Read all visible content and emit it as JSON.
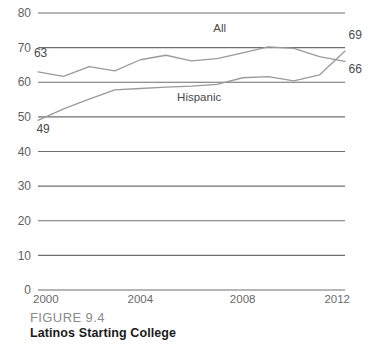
{
  "figure": {
    "number_label": "FIGURE 9.4",
    "title": "Latinos Starting College"
  },
  "colors": {
    "gridline": "#6e6e6e",
    "series_all": "#9a9a9a",
    "series_hispanic": "#9a9a9a",
    "axis_text": "#5f5f5f",
    "caption_number": "#8a8a8a",
    "caption_title": "#1a1a1a",
    "background": "#ffffff"
  },
  "chart_data": {
    "type": "line",
    "title": "Latinos Starting College",
    "xlabel": "",
    "ylabel": "",
    "xlim": [
      2000,
      2012
    ],
    "ylim": [
      0,
      80
    ],
    "grid": true,
    "legend_position": "inline-annotation",
    "ytick_labels": [
      "80",
      "70",
      "60",
      "50",
      "40",
      "30",
      "20",
      "10",
      "0"
    ],
    "yticks": [
      80,
      70,
      60,
      50,
      40,
      30,
      20,
      10,
      0
    ],
    "xtick_labels": [
      "2000",
      "2004",
      "2008",
      "2012"
    ],
    "xticks": [
      2000,
      2004,
      2008,
      2012
    ],
    "x": [
      2000,
      2001,
      2002,
      2003,
      2004,
      2005,
      2006,
      2007,
      2008,
      2009,
      2010,
      2011,
      2012
    ],
    "series": [
      {
        "name": "All",
        "label": "All",
        "values": [
          63,
          61.7,
          64.5,
          63.3,
          66.5,
          67.8,
          66.2,
          66.8,
          68.5,
          70.2,
          69.8,
          67.4,
          66
        ],
        "start_value_label": "63",
        "end_value_label": "66"
      },
      {
        "name": "Hispanic",
        "label": "Hispanic",
        "values": [
          49,
          52.3,
          55.1,
          57.8,
          58.2,
          58.6,
          58.9,
          59.4,
          61.3,
          61.6,
          60.4,
          62.1,
          69
        ],
        "start_value_label": "49",
        "end_value_label": "69"
      }
    ],
    "annotations": [
      {
        "text": "All",
        "x": 2007.1,
        "y": 74.4
      },
      {
        "text": "Hispanic",
        "x": 2006.3,
        "y": 54.5
      },
      {
        "text": "63",
        "x": 2000.1,
        "y": 67.2
      },
      {
        "text": "49",
        "x": 2000.2,
        "y": 45.2
      },
      {
        "text": "69",
        "x": 2012.4,
        "y": 72.4
      },
      {
        "text": "66",
        "x": 2012.4,
        "y": 62.6
      }
    ]
  }
}
